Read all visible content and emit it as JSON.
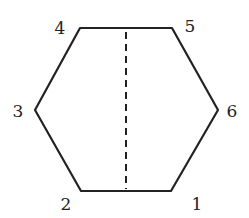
{
  "diagram": {
    "shape": "hexagon",
    "stroke_color": "#222222",
    "vertices": [
      {
        "label": "1",
        "x": 171,
        "y": 191,
        "lx": 197,
        "ly": 210
      },
      {
        "label": "2",
        "x": 81,
        "y": 191,
        "lx": 66,
        "ly": 210
      },
      {
        "label": "3",
        "x": 35,
        "y": 110,
        "lx": 18,
        "ly": 117
      },
      {
        "label": "4",
        "x": 80,
        "y": 28,
        "lx": 60,
        "ly": 34
      },
      {
        "label": "5",
        "x": 172,
        "y": 28,
        "lx": 190,
        "ly": 32
      },
      {
        "label": "6",
        "x": 218,
        "y": 110,
        "lx": 232,
        "ly": 117
      }
    ],
    "dashed_line": {
      "x1": 126,
      "y1": 32,
      "x2": 126,
      "y2": 189
    }
  }
}
